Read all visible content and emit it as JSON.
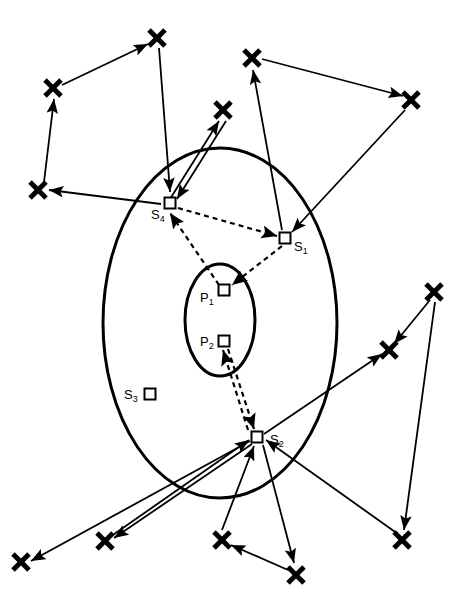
{
  "figure": {
    "title": "",
    "background": "#ffffff",
    "stroke": "#000000",
    "width": 461,
    "height": 613
  },
  "regions": [
    {
      "name": "outer-ellipse",
      "shape": "ellipse",
      "cx": 220,
      "cy": 323,
      "rx": 117,
      "ry": 175,
      "stroke_width": 3
    },
    {
      "name": "inner-ellipse",
      "shape": "ellipse",
      "cx": 220,
      "cy": 320,
      "rx": 35,
      "ry": 56,
      "stroke_width": 3
    }
  ],
  "nodes": [
    {
      "id": "S4",
      "label": "S",
      "sub": "4",
      "x": 170,
      "y": 203,
      "label_x": 151,
      "label_y": 219,
      "marker": "square"
    },
    {
      "id": "S1",
      "label": "S",
      "sub": "1",
      "x": 285,
      "y": 238,
      "label_x": 294,
      "label_y": 251,
      "marker": "square"
    },
    {
      "id": "P1",
      "label": "P",
      "sub": "1",
      "x": 224,
      "y": 290,
      "label_x": 200,
      "label_y": 302,
      "marker": "square"
    },
    {
      "id": "P2",
      "label": "P",
      "sub": "2",
      "x": 224,
      "y": 341,
      "label_x": 200,
      "label_y": 346,
      "marker": "square"
    },
    {
      "id": "S3",
      "label": "S",
      "sub": "3",
      "x": 150,
      "y": 394,
      "label_x": 124,
      "label_y": 399,
      "marker": "square"
    },
    {
      "id": "S2",
      "label": "S",
      "sub": "2",
      "x": 257,
      "y": 437,
      "label_x": 270,
      "label_y": 444,
      "marker": "square"
    }
  ],
  "crosses": [
    {
      "id": "x-top-left-upper",
      "x": 157,
      "y": 38
    },
    {
      "id": "x-left-upper",
      "x": 53,
      "y": 88
    },
    {
      "id": "x-left-mid",
      "x": 38,
      "y": 190
    },
    {
      "id": "x-top-center",
      "x": 223,
      "y": 110
    },
    {
      "id": "x-top-right-inner",
      "x": 252,
      "y": 58
    },
    {
      "id": "x-top-right-outer",
      "x": 411,
      "y": 100
    },
    {
      "id": "x-right-upper",
      "x": 434,
      "y": 292
    },
    {
      "id": "x-right-mid",
      "x": 389,
      "y": 350
    },
    {
      "id": "x-right-lower",
      "x": 402,
      "y": 540
    },
    {
      "id": "x-bottom-left-outer",
      "x": 21,
      "y": 562
    },
    {
      "id": "x-bottom-left-inner",
      "x": 105,
      "y": 541
    },
    {
      "id": "x-bottom-center",
      "x": 222,
      "y": 540
    },
    {
      "id": "x-bottom-center-low",
      "x": 296,
      "y": 575
    }
  ],
  "solid_edges": [
    {
      "id": "e1",
      "from": "x-left-upper",
      "to": "x-top-left-upper",
      "x1": 62,
      "y1": 85,
      "x2": 148,
      "y2": 44
    },
    {
      "id": "e2",
      "from": "x-left-mid",
      "to": "x-left-upper",
      "x1": 44,
      "y1": 182,
      "x2": 54,
      "y2": 99
    },
    {
      "id": "e3",
      "from": "x-top-left-upper",
      "to": "S4",
      "x1": 159,
      "y1": 48,
      "x2": 170,
      "y2": 192
    },
    {
      "id": "e4",
      "from": "S4",
      "to": "x-left-mid",
      "x1": 161,
      "y1": 204,
      "x2": 49,
      "y2": 190
    },
    {
      "id": "e5",
      "from": "S4",
      "to": "x-top-center",
      "x1": 170,
      "y1": 199,
      "x2": 219,
      "y2": 121
    },
    {
      "id": "e6",
      "from": "x-top-center",
      "to": "S4",
      "x1": 226,
      "y1": 121,
      "x2": 177,
      "y2": 199
    },
    {
      "id": "e7",
      "from": "x-top-right-inner",
      "to": "x-top-right-outer",
      "x1": 262,
      "y1": 59,
      "x2": 403,
      "y2": 96
    },
    {
      "id": "e8",
      "from": "S1",
      "to": "x-top-right-inner",
      "x1": 282,
      "y1": 230,
      "x2": 253,
      "y2": 70
    },
    {
      "id": "e9",
      "from": "x-top-right-outer",
      "to": "S1",
      "x1": 405,
      "y1": 110,
      "x2": 292,
      "y2": 232
    },
    {
      "id": "e10",
      "from": "x-right-upper",
      "to": "x-right-mid",
      "x1": 430,
      "y1": 300,
      "x2": 394,
      "y2": 344
    },
    {
      "id": "e11",
      "from": "S2",
      "to": "x-right-mid",
      "x1": 264,
      "y1": 434,
      "x2": 382,
      "y2": 354
    },
    {
      "id": "e12",
      "from": "x-right-upper",
      "to": "x-right-lower",
      "x1": 435,
      "y1": 302,
      "x2": 404,
      "y2": 530
    },
    {
      "id": "e13",
      "from": "S2",
      "to": "x-bottom-left-outer",
      "x1": 250,
      "y1": 441,
      "x2": 31,
      "y2": 561
    },
    {
      "id": "e14",
      "from": "x-bottom-left-inner",
      "to": "S2",
      "x1": 110,
      "y1": 537,
      "x2": 249,
      "y2": 440
    },
    {
      "id": "e15",
      "from": "S2",
      "to": "x-bottom-left-inner",
      "x1": 252,
      "y1": 444,
      "x2": 114,
      "y2": 538
    },
    {
      "id": "e16",
      "from": "x-bottom-center",
      "to": "S2",
      "x1": 222,
      "y1": 530,
      "x2": 254,
      "y2": 446
    },
    {
      "id": "e17",
      "from": "S2",
      "to": "x-bottom-center-low",
      "x1": 263,
      "y1": 445,
      "x2": 294,
      "y2": 563
    },
    {
      "id": "e18",
      "from": "x-bottom-center-low",
      "to": "x-bottom-center",
      "x1": 288,
      "y1": 570,
      "x2": 231,
      "y2": 545
    },
    {
      "id": "e19",
      "from": "x-right-lower",
      "to": "S2",
      "x1": 398,
      "y1": 534,
      "x2": 266,
      "y2": 440
    }
  ],
  "dashed_edges": [
    {
      "id": "d1",
      "from": "S4",
      "to": "S1",
      "x1": 178,
      "y1": 208,
      "x2": 277,
      "y2": 236
    },
    {
      "id": "d2",
      "from": "S1",
      "to": "P1",
      "x1": 282,
      "y1": 246,
      "x2": 232,
      "y2": 285
    },
    {
      "id": "d3",
      "from": "P1",
      "to": "S4",
      "x1": 219,
      "y1": 285,
      "x2": 170,
      "y2": 213
    },
    {
      "id": "d4",
      "from": "P2",
      "to": "S2",
      "x1": 228,
      "y1": 349,
      "x2": 254,
      "y2": 429
    },
    {
      "id": "d5",
      "from": "S2",
      "to": "P2",
      "x1": 248,
      "y1": 430,
      "x2": 223,
      "y2": 350
    }
  ],
  "legend": {
    "square_meaning": "sensor/point node",
    "cross_meaning": "external point",
    "dashed_meaning": "internal link",
    "solid_meaning": "external link"
  }
}
